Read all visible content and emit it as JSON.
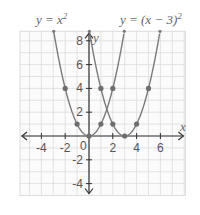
{
  "chart_data": {
    "type": "line",
    "title": "",
    "xlabel": "x",
    "ylabel": "y",
    "xlim": [
      -5.8,
      8.1
    ],
    "ylim": [
      -5,
      8.8
    ],
    "grid": true,
    "x_ticks": [
      -4,
      -2,
      2,
      4,
      6
    ],
    "y_ticks": [
      -4,
      -2,
      2,
      4,
      6,
      8
    ],
    "x_tick_labels": [
      "-4",
      "-2",
      "2",
      "4",
      "6"
    ],
    "y_tick_labels": [
      "-4",
      "-2",
      "2",
      "4",
      "6",
      "8"
    ],
    "origin_label": "0",
    "series": [
      {
        "name": "y = x^2",
        "label_text": "y = x",
        "label_sup": "2",
        "function": "x^2",
        "points": [
          [
            -2,
            4
          ],
          [
            -1,
            1
          ],
          [
            0,
            0
          ],
          [
            1,
            1
          ],
          [
            2,
            4
          ]
        ]
      },
      {
        "name": "y = (x - 3)^2",
        "label_text": "y = (x − 3)",
        "label_sup": "2",
        "function": "(x-3)^2",
        "points": [
          [
            1,
            4
          ],
          [
            2,
            1
          ],
          [
            3,
            0
          ],
          [
            4,
            1
          ],
          [
            5,
            4
          ]
        ]
      }
    ],
    "colors": {
      "curve": "#7a7a7a",
      "grid": "#dcdcdc",
      "axis": "#333333",
      "point": "#6e6e6e"
    }
  }
}
